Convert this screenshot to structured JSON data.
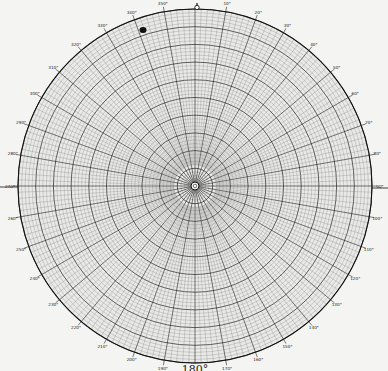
{
  "chart_data": {
    "type": "polar-grid",
    "title": "",
    "center": [
      195,
      186
    ],
    "radius": 177,
    "angle_zero": "top",
    "angle_direction": "clockwise",
    "angle_labels_step_deg": 10,
    "angle_labels": [
      "0",
      "10°",
      "20°",
      "30°",
      "40°",
      "50°",
      "60°",
      "70°",
      "80°",
      "90°",
      "100°",
      "110°",
      "120°",
      "130°",
      "140°",
      "150°",
      "160°",
      "170°",
      "180°",
      "190°",
      "200°",
      "210°",
      "220°",
      "230°",
      "240°",
      "250°",
      "260°",
      "270°",
      "280°",
      "290°",
      "300°",
      "310°",
      "320°",
      "330°",
      "340°",
      "350°"
    ],
    "major_axis_labels": {
      "top": "0",
      "right": "90°",
      "bottom": "180°",
      "left": "270°"
    },
    "radial_minor_step_deg": 2,
    "radial_major_step_deg": 10,
    "ring_count_minor": 50,
    "ring_major_every": 5,
    "colors": {
      "paper": "#f4f4f2",
      "grid_minor": "#7a7a7a",
      "grid_major": "#202020",
      "ink": "#111111"
    },
    "annotations": [
      {
        "type": "ink-spot",
        "position": [
          143,
          30
        ]
      }
    ]
  }
}
